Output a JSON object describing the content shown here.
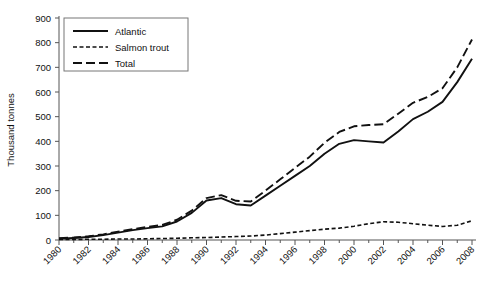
{
  "chart_data": {
    "type": "line",
    "title": "",
    "xlabel": "",
    "ylabel": "Thousand tonnes",
    "ylim": [
      0,
      900
    ],
    "ytick_step": 100,
    "yticks": [
      0,
      100,
      200,
      300,
      400,
      500,
      600,
      700,
      800,
      900
    ],
    "xlim": [
      1980,
      2008
    ],
    "xticks": [
      1980,
      1982,
      1984,
      1986,
      1988,
      1990,
      1992,
      1994,
      1996,
      1998,
      2000,
      2002,
      2004,
      2006,
      2008
    ],
    "minor_xticks": [
      1981,
      1983,
      1985,
      1987,
      1989,
      1991,
      1993,
      1995,
      1997,
      1999,
      2001,
      2003,
      2005,
      2007
    ],
    "xtick_labels": [
      "1980",
      "1982",
      "1984",
      "1986",
      "1988",
      "1990",
      "1992",
      "1994",
      "1996",
      "1998",
      "2000",
      "2002",
      "2004",
      "2006",
      "2008"
    ],
    "x": [
      1980,
      1981,
      1982,
      1983,
      1984,
      1985,
      1986,
      1987,
      1988,
      1989,
      1990,
      1991,
      1992,
      1993,
      1994,
      1995,
      1996,
      1997,
      1998,
      1999,
      2000,
      2001,
      2002,
      2003,
      2004,
      2005,
      2006,
      2007,
      2008
    ],
    "grid": false,
    "legend_position": "top-left",
    "series": [
      {
        "name": "Atlantic",
        "style": "solid",
        "values": [
          5,
          8,
          12,
          20,
          30,
          40,
          48,
          55,
          75,
          110,
          160,
          170,
          145,
          140,
          180,
          220,
          260,
          300,
          350,
          390,
          405,
          400,
          395,
          440,
          490,
          520,
          560,
          640,
          735
        ]
      },
      {
        "name": "Salmon trout",
        "style": "dotted",
        "values": [
          2,
          2,
          3,
          3,
          4,
          4,
          5,
          6,
          7,
          9,
          10,
          12,
          14,
          16,
          20,
          26,
          32,
          38,
          44,
          48,
          56,
          66,
          74,
          72,
          66,
          60,
          55,
          60,
          78
        ]
      },
      {
        "name": "Total",
        "style": "dashed",
        "values": [
          7,
          10,
          15,
          23,
          34,
          44,
          53,
          61,
          82,
          119,
          170,
          182,
          159,
          156,
          200,
          246,
          292,
          338,
          394,
          438,
          461,
          466,
          469,
          512,
          556,
          580,
          615,
          700,
          813
        ]
      }
    ]
  },
  "legend": {
    "entries": [
      {
        "label": "Atlantic",
        "style": "solid"
      },
      {
        "label": "Salmon trout",
        "style": "dotted"
      },
      {
        "label": "Total",
        "style": "dashed"
      }
    ]
  },
  "axis": {
    "y_title": "Thousand tonnes"
  }
}
